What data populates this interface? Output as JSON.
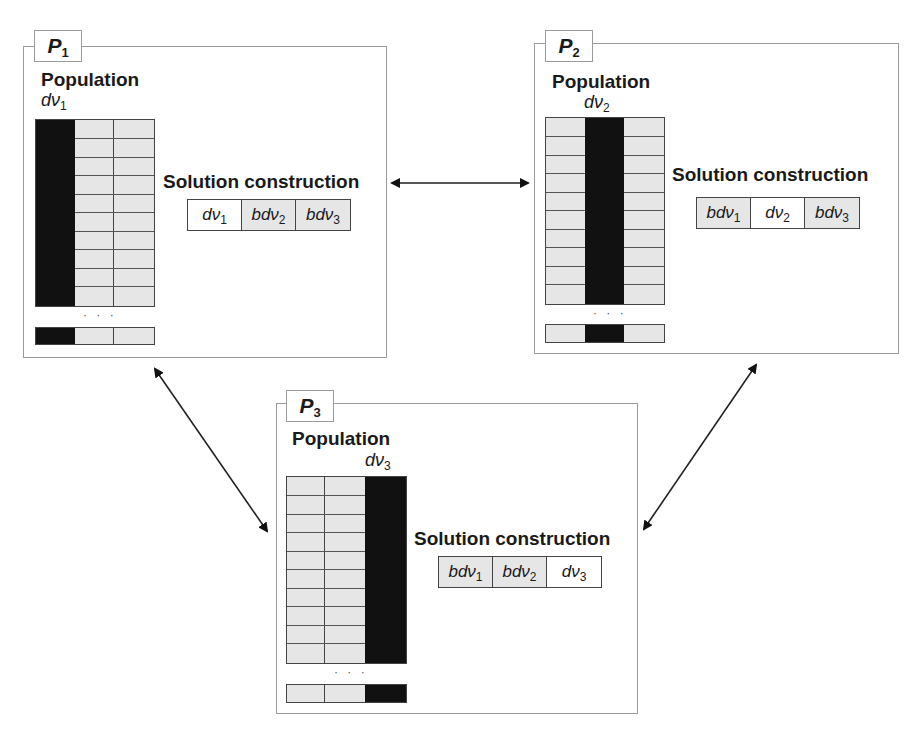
{
  "panels": [
    {
      "id": "P1",
      "label": "P",
      "sub": "1",
      "title": "Population",
      "var": "dν",
      "var_sub": "1",
      "highlight_col": 0,
      "solution_title": "Solution construction",
      "solution": [
        {
          "text": "dν",
          "sub": "1",
          "shaded": false
        },
        {
          "text": "bdν",
          "sub": "2",
          "shaded": true
        },
        {
          "text": "bdν",
          "sub": "3",
          "shaded": true
        }
      ]
    },
    {
      "id": "P2",
      "label": "P",
      "sub": "2",
      "title": "Population",
      "var": "dν",
      "var_sub": "2",
      "highlight_col": 1,
      "solution_title": "Solution construction",
      "solution": [
        {
          "text": "bdν",
          "sub": "1",
          "shaded": true
        },
        {
          "text": "dν",
          "sub": "2",
          "shaded": false
        },
        {
          "text": "bdν",
          "sub": "3",
          "shaded": true
        }
      ]
    },
    {
      "id": "P3",
      "label": "P",
      "sub": "3",
      "title": "Population",
      "var": "dν",
      "var_sub": "3",
      "highlight_col": 2,
      "solution_title": "Solution construction",
      "solution": [
        {
          "text": "bdν",
          "sub": "1",
          "shaded": true
        },
        {
          "text": "bdν",
          "sub": "2",
          "shaded": true
        },
        {
          "text": "dν",
          "sub": "3",
          "shaded": false
        }
      ]
    }
  ],
  "ellipsis": "· · ·",
  "arrows": [
    {
      "from": "P1",
      "to": "P2",
      "type": "bidirectional"
    },
    {
      "from": "P1",
      "to": "P3",
      "type": "bidirectional"
    },
    {
      "from": "P2",
      "to": "P3",
      "type": "bidirectional"
    }
  ],
  "colors": {
    "highlight": "#111111",
    "shaded": "#e6e6e6",
    "border": "#9a9a9a"
  }
}
